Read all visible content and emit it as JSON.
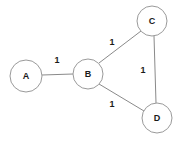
{
  "diagram": {
    "background_color": "#ffffff",
    "node_fill_color": "#ffffff",
    "node_stroke_color": "#9a9a9a",
    "edge_stroke_color": "#8a8a8a",
    "label_color": "#1a1a1a",
    "nodes": [
      {
        "id": "A",
        "label": "A",
        "cx": 26,
        "cy": 76,
        "r": 16
      },
      {
        "id": "B",
        "label": "B",
        "cx": 88,
        "cy": 74,
        "r": 15
      },
      {
        "id": "C",
        "label": "C",
        "cx": 152,
        "cy": 21,
        "r": 15
      },
      {
        "id": "D",
        "label": "D",
        "cx": 157,
        "cy": 118,
        "r": 15
      }
    ],
    "edges": [
      {
        "id": "A-B",
        "from": "A",
        "to": "B",
        "weight": "1",
        "x1": 42,
        "y1": 75,
        "x2": 73,
        "y2": 74,
        "label_x": 57,
        "label_y": 60
      },
      {
        "id": "B-C",
        "from": "B",
        "to": "C",
        "weight": "1",
        "x1": 99,
        "y1": 63,
        "x2": 141,
        "y2": 31,
        "label_x": 112,
        "label_y": 42
      },
      {
        "id": "B-D",
        "from": "B",
        "to": "D",
        "weight": "1",
        "x1": 99,
        "y1": 84,
        "x2": 144,
        "y2": 111,
        "label_x": 112,
        "label_y": 104
      },
      {
        "id": "C-D",
        "from": "C",
        "to": "D",
        "weight": "1",
        "x1": 154,
        "y1": 36,
        "x2": 156,
        "y2": 103,
        "label_x": 143,
        "label_y": 70
      }
    ]
  }
}
